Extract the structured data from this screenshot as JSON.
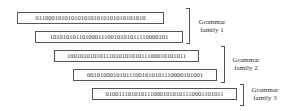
{
  "strings": [
    "0110001010101010101010101010101010",
    "1010101011010001110010101011110000101",
    "1001010101011101010101011100010101011",
    "001010001010111001010101110000101001",
    "0100111010101110001010101110001101011"
  ],
  "families": [
    {
      "label_line1": "Grammar",
      "label_line2": "family 1"
    },
    {
      "label_line1": "Grammar",
      "label_line2": "family 2"
    },
    {
      "label_line1": "Grammar",
      "label_line2": "family 3"
    }
  ]
}
